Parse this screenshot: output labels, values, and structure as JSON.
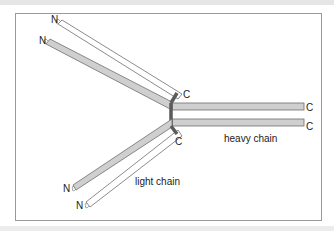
{
  "figure": {
    "labels": {
      "n_terminus": "N",
      "c_terminus": "C",
      "heavy_chain": "heavy chain",
      "light_chain": "light chain"
    },
    "colors": {
      "heavy_chain_fill": "#cfcfcf",
      "light_chain_fill": "#ffffff",
      "outline": "#6e6e6e",
      "disulfide_bond": "#5a5a5a",
      "frame_border": "#9a9a9a"
    }
  }
}
